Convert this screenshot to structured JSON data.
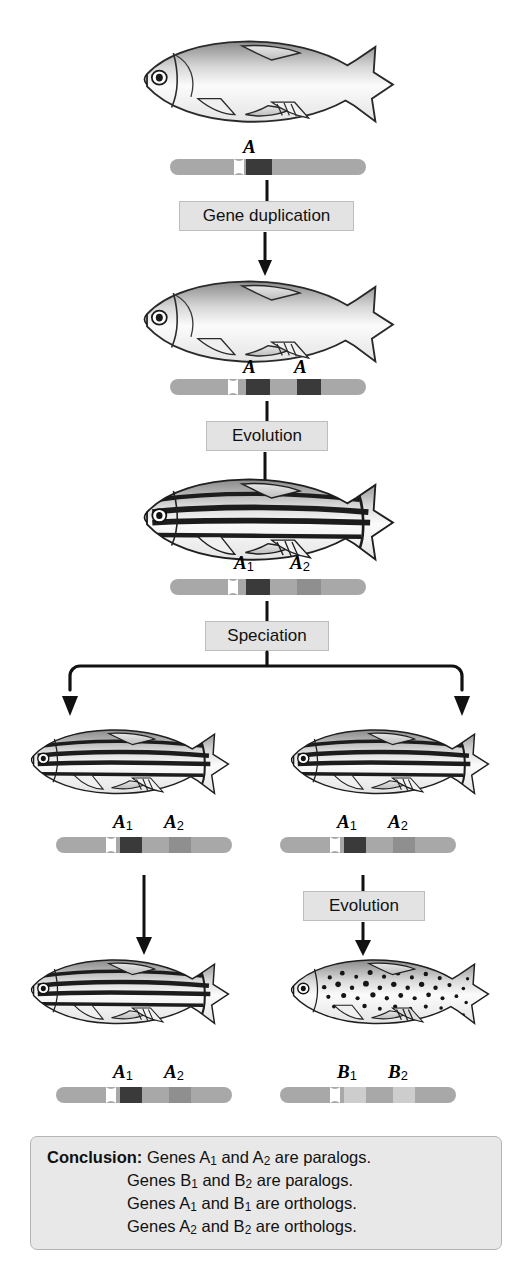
{
  "figure": {
    "background_color": "#ffffff",
    "box_fill": "#e3e3e3",
    "box_border": "#bdbdbd",
    "chromosome_color": "#a8a8a8",
    "gene_dark_color": "#3a3a3a",
    "gene_mid_color": "#8f8f8f",
    "gene_light_color": "#c9c9c9",
    "arrow_color": "#111111"
  },
  "process_boxes": [
    {
      "id": "gene-duplication",
      "label": "Gene duplication"
    },
    {
      "id": "evolution-1",
      "label": "Evolution"
    },
    {
      "id": "speciation",
      "label": "Speciation"
    },
    {
      "id": "evolution-2",
      "label": "Evolution"
    }
  ],
  "organisms": [
    {
      "id": "ancestral-fish",
      "name": "ancestral plain fish",
      "pattern": "plain"
    },
    {
      "id": "duplicated-fish",
      "name": "fish after gene duplication",
      "pattern": "plain"
    },
    {
      "id": "striped-fish",
      "name": "striped zebrafish ancestor",
      "pattern": "striped"
    },
    {
      "id": "species-1-before",
      "name": "species 1 striped fish",
      "pattern": "striped"
    },
    {
      "id": "species-2-before",
      "name": "species 2 striped fish",
      "pattern": "striped"
    },
    {
      "id": "species-1-after",
      "name": "species 1 striped fish descendant",
      "pattern": "striped"
    },
    {
      "id": "species-2-after",
      "name": "species 2 spotted fish descendant",
      "pattern": "spotted"
    }
  ],
  "chromosomes": [
    {
      "id": "chrom-ancestral",
      "genes": [
        {
          "label": "A",
          "subscript": "",
          "shade": "dark"
        }
      ]
    },
    {
      "id": "chrom-duplicated",
      "genes": [
        {
          "label": "A",
          "subscript": "",
          "shade": "dark"
        },
        {
          "label": "A",
          "subscript": "",
          "shade": "dark"
        }
      ]
    },
    {
      "id": "chrom-evolved",
      "genes": [
        {
          "label": "A",
          "subscript": "1",
          "shade": "dark"
        },
        {
          "label": "A",
          "subscript": "2",
          "shade": "mid"
        }
      ]
    },
    {
      "id": "chrom-species-1-before",
      "genes": [
        {
          "label": "A",
          "subscript": "1",
          "shade": "dark"
        },
        {
          "label": "A",
          "subscript": "2",
          "shade": "mid"
        }
      ]
    },
    {
      "id": "chrom-species-2-before",
      "genes": [
        {
          "label": "A",
          "subscript": "1",
          "shade": "dark"
        },
        {
          "label": "A",
          "subscript": "2",
          "shade": "mid"
        }
      ]
    },
    {
      "id": "chrom-species-1-after",
      "genes": [
        {
          "label": "A",
          "subscript": "1",
          "shade": "dark"
        },
        {
          "label": "A",
          "subscript": "2",
          "shade": "mid"
        }
      ]
    },
    {
      "id": "chrom-species-2-after",
      "genes": [
        {
          "label": "B",
          "subscript": "1",
          "shade": "light"
        },
        {
          "label": "B",
          "subscript": "2",
          "shade": "light"
        }
      ]
    }
  ],
  "gene_labels": {
    "anc_a": "A",
    "dup_a_left": "A",
    "dup_a_right": "A",
    "evo_a1": "A",
    "evo_a1_sub": "1",
    "evo_a2": "A",
    "evo_a2_sub": "2",
    "sp1_a1": "A",
    "sp1_a1_sub": "1",
    "sp1_a2": "A",
    "sp1_a2_sub": "2",
    "sp2_a1": "A",
    "sp2_a1_sub": "1",
    "sp2_a2": "A",
    "sp2_a2_sub": "2",
    "sp1f_a1": "A",
    "sp1f_a1_sub": "1",
    "sp1f_a2": "A",
    "sp1f_a2_sub": "2",
    "sp2f_b1": "B",
    "sp2f_b1_sub": "1",
    "sp2f_b2": "B",
    "sp2f_b2_sub": "2"
  },
  "conclusion": {
    "label": "Conclusion:",
    "lines": [
      {
        "text_pre": "Genes A",
        "sub1": "1",
        "mid": " and A",
        "sub2": "2",
        "text_post": " are paralogs."
      },
      {
        "text_pre": "Genes B",
        "sub1": "1",
        "mid": " and B",
        "sub2": "2",
        "text_post": " are paralogs."
      },
      {
        "text_pre": "Genes A",
        "sub1": "1",
        "mid": " and B",
        "sub2": "1",
        "text_post": " are orthologs."
      },
      {
        "text_pre": "Genes A",
        "sub1": "2",
        "mid": " and B",
        "sub2": "2",
        "text_post": " are orthologs."
      }
    ],
    "line_1_full": "Genes A1 and A2 are paralogs.",
    "line_2_full": "Genes B1 and B2 are paralogs.",
    "line_3_full": "Genes A1 and B1 are orthologs.",
    "line_4_full": "Genes A2 and B2 are orthologs."
  }
}
